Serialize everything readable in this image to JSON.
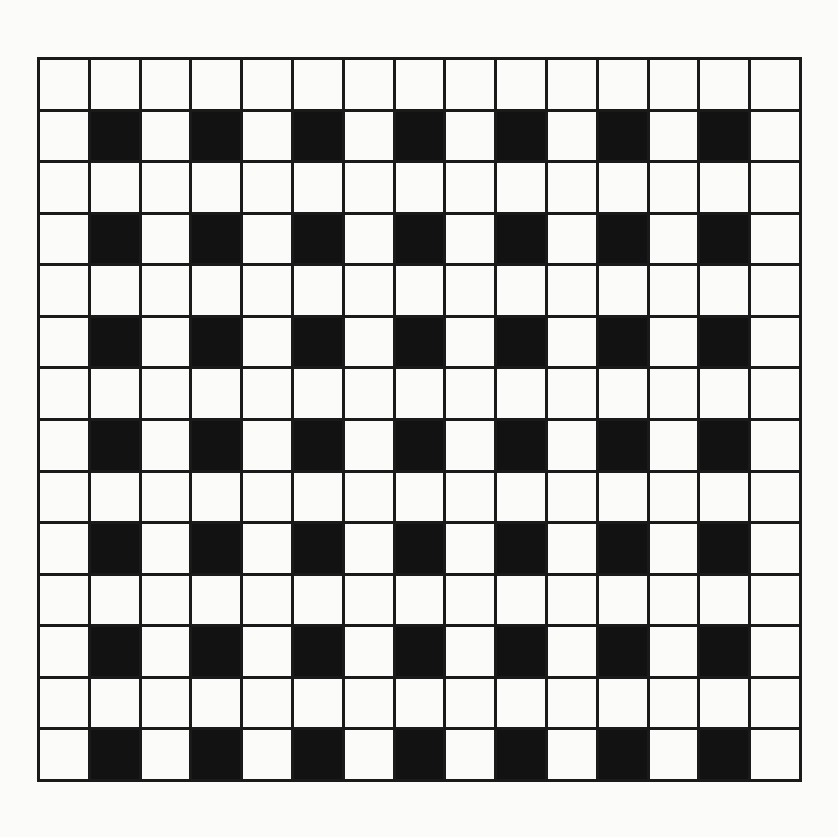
{
  "figure": {
    "name": "checkerboard-grid-pattern",
    "page_background_color": "#fbfbfa",
    "cell_background_color": "#fbfbfa",
    "cell_filled_color": "#121212",
    "grid_line_color": "#1a1a1a",
    "grid_line_width_px": 3,
    "border_width_px": 3,
    "origin_x_px": 37,
    "origin_y_px": 57,
    "grid_width_px": 765,
    "grid_height_px": 725,
    "cell_width_px": 51,
    "cell_height_px": 51.8
  },
  "chart_data": {
    "type": "heatmap",
    "title": "",
    "subtitle": "",
    "xlabel": "",
    "ylabel": "",
    "columns": 15,
    "rows": 14,
    "legend": [],
    "annotations": [],
    "grid": true,
    "value_labels": {
      "0": "empty",
      "1": "filled"
    },
    "column_ticks": [
      "1",
      "2",
      "3",
      "4",
      "5",
      "6",
      "7",
      "8",
      "9",
      "10",
      "11",
      "12",
      "13",
      "14",
      "15"
    ],
    "row_ticks": [
      "1",
      "2",
      "3",
      "4",
      "5",
      "6",
      "7",
      "8",
      "9",
      "10",
      "11",
      "12",
      "13",
      "14"
    ],
    "values": [
      [
        0,
        0,
        0,
        0,
        0,
        0,
        0,
        0,
        0,
        0,
        0,
        0,
        0,
        0,
        0
      ],
      [
        0,
        1,
        0,
        1,
        0,
        1,
        0,
        1,
        0,
        1,
        0,
        1,
        0,
        1,
        0
      ],
      [
        0,
        0,
        0,
        0,
        0,
        0,
        0,
        0,
        0,
        0,
        0,
        0,
        0,
        0,
        0
      ],
      [
        0,
        1,
        0,
        1,
        0,
        1,
        0,
        1,
        0,
        1,
        0,
        1,
        0,
        1,
        0
      ],
      [
        0,
        0,
        0,
        0,
        0,
        0,
        0,
        0,
        0,
        0,
        0,
        0,
        0,
        0,
        0
      ],
      [
        0,
        1,
        0,
        1,
        0,
        1,
        0,
        1,
        0,
        1,
        0,
        1,
        0,
        1,
        0
      ],
      [
        0,
        0,
        0,
        0,
        0,
        0,
        0,
        0,
        0,
        0,
        0,
        0,
        0,
        0,
        0
      ],
      [
        0,
        1,
        0,
        1,
        0,
        1,
        0,
        1,
        0,
        1,
        0,
        1,
        0,
        1,
        0
      ],
      [
        0,
        0,
        0,
        0,
        0,
        0,
        0,
        0,
        0,
        0,
        0,
        0,
        0,
        0,
        0
      ],
      [
        0,
        1,
        0,
        1,
        0,
        1,
        0,
        1,
        0,
        1,
        0,
        1,
        0,
        1,
        0
      ],
      [
        0,
        0,
        0,
        0,
        0,
        0,
        0,
        0,
        0,
        0,
        0,
        0,
        0,
        0,
        0
      ],
      [
        0,
        1,
        0,
        1,
        0,
        1,
        0,
        1,
        0,
        1,
        0,
        1,
        0,
        1,
        0
      ],
      [
        0,
        0,
        0,
        0,
        0,
        0,
        0,
        0,
        0,
        0,
        0,
        0,
        0,
        0,
        0
      ],
      [
        0,
        1,
        0,
        1,
        0,
        1,
        0,
        1,
        0,
        1,
        0,
        1,
        0,
        1,
        0
      ]
    ]
  }
}
